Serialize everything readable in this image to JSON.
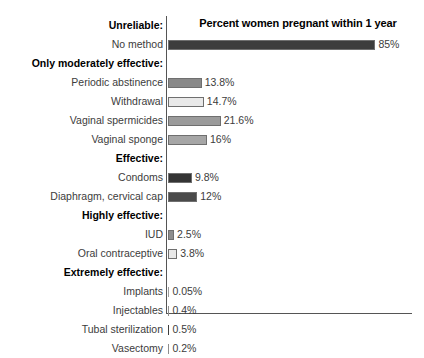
{
  "chart_data": {
    "type": "bar",
    "title": "Percent women pregnant within 1 year",
    "xlabel": "",
    "ylabel": "",
    "orientation": "horizontal",
    "grid": false,
    "legend": null,
    "xlim": [
      0,
      100
    ],
    "axis_color": "#555555",
    "value_suffix": "%",
    "groups": [
      {
        "header": "Unreliable:",
        "items": [
          {
            "label": "No method",
            "value": 85,
            "value_text": "85%",
            "color": "#3d3d3d"
          }
        ]
      },
      {
        "header": "Only moderately effective:",
        "items": [
          {
            "label": "Periodic abstinence",
            "value": 13.8,
            "value_text": "13.8%",
            "color": "#898989"
          },
          {
            "label": "Withdrawal",
            "value": 14.7,
            "value_text": "14.7%",
            "color": "#e9e9e9"
          },
          {
            "label": "Vaginal spermicides",
            "value": 21.6,
            "value_text": "21.6%",
            "color": "#9b9b9b"
          },
          {
            "label": "Vaginal sponge",
            "value": 16,
            "value_text": "16%",
            "color": "#a6a6a6"
          }
        ]
      },
      {
        "header": "Effective:",
        "items": [
          {
            "label": "Condoms",
            "value": 9.8,
            "value_text": "9.8%",
            "color": "#343434"
          },
          {
            "label": "Diaphragm, cervical cap",
            "value": 12,
            "value_text": "12%",
            "color": "#4a4a4a"
          }
        ]
      },
      {
        "header": "Highly effective:",
        "items": [
          {
            "label": "IUD",
            "value": 2.5,
            "value_text": "2.5%",
            "color": "#8d8d8d"
          },
          {
            "label": "Oral contraceptive",
            "value": 3.8,
            "value_text": "3.8%",
            "color": "#e9e9e9"
          }
        ]
      },
      {
        "header": "Extremely effective:",
        "items": [
          {
            "label": "Implants",
            "value": 0.05,
            "value_text": "0.05%",
            "color": "#9b9b9b"
          },
          {
            "label": "Injectables",
            "value": 0.4,
            "value_text": "0.4%",
            "color": "#8d8d8d"
          },
          {
            "label": "Tubal sterilization",
            "value": 0.5,
            "value_text": "0.5%",
            "color": "#3d3d3d"
          },
          {
            "label": "Vasectomy",
            "value": 0.2,
            "value_text": "0.2%",
            "color": "#8d8d8d"
          }
        ]
      }
    ]
  }
}
